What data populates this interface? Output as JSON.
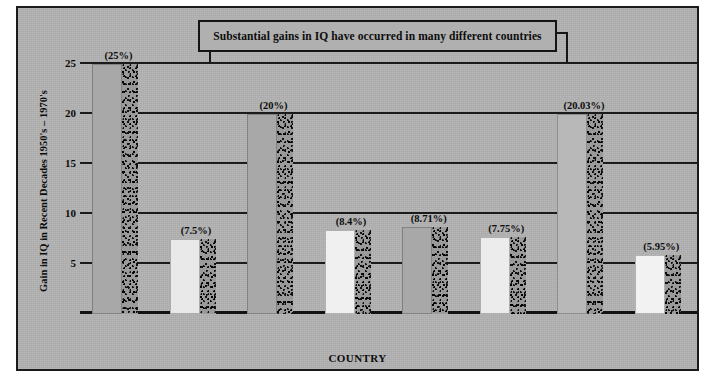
{
  "title": "Substantial gains in IQ have occurred in many different countries",
  "colors": {
    "background": "#b3b3b3",
    "frame": "#1a1a1a",
    "title_box_fill": "#b0b0b0",
    "gridline": "#1b1b1b",
    "bar_light": "#e8e8e8",
    "bar_gray": "#a8a8a8",
    "bar_shadow": "#4a4a4a"
  },
  "chart_data": {
    "type": "bar",
    "title": "Substantial gains in IQ have occurred in many different countries",
    "xlabel": "COUNTRY",
    "ylabel": "Gain in IQ in Recent Decades 1950's – 1970's",
    "categories": [
      "France",
      "Belgium",
      "Netherlands",
      "Australia",
      "Canada",
      "Great Britain",
      "Japan",
      "U.S."
    ],
    "values": [
      25,
      7.5,
      20,
      8.4,
      8.71,
      7.75,
      20.03,
      5.95
    ],
    "data_labels": [
      "(25%)",
      "(7.5%)",
      "(20%)",
      "(8.4%)",
      "(8.71%)",
      "(7.75%)",
      "(20.03%)",
      "(5.95%)"
    ],
    "bar_fills": [
      "#a8a8a8",
      "#e9e9e9",
      "#a8a8a8",
      "#f0f0f0",
      "#a8a8a8",
      "#ececec",
      "#b8b8b8",
      "#f2f2f2"
    ],
    "ylim": [
      0,
      25
    ],
    "yticks": [
      5,
      10,
      15,
      20,
      25
    ],
    "ytick_labels": [
      "5",
      "10",
      "15",
      "20",
      "25"
    ],
    "grid": true,
    "legend": "none"
  }
}
